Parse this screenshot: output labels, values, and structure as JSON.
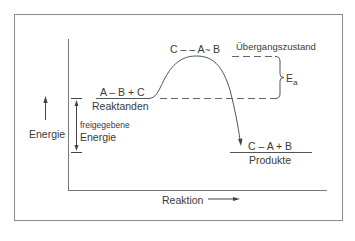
{
  "diagram": {
    "type": "energy-profile",
    "axis": {
      "y_label": "Energie",
      "x_label": "Reaktion"
    },
    "reactants": {
      "formula": "A – B + C",
      "label": "Reaktanden"
    },
    "transition_state": {
      "formula_left": "C – – A",
      "formula_tilde": "~",
      "formula_right": "B",
      "label": "Übergangszustand"
    },
    "activation_energy": {
      "symbol": "E",
      "subscript": "a"
    },
    "released_energy": {
      "line1": "freigegebene",
      "line2": "Energie"
    },
    "products": {
      "formula": "C – A + B",
      "label": "Produkte"
    },
    "colors": {
      "line": "#555555",
      "text": "#3a3a3a",
      "frame": "#888888"
    }
  }
}
